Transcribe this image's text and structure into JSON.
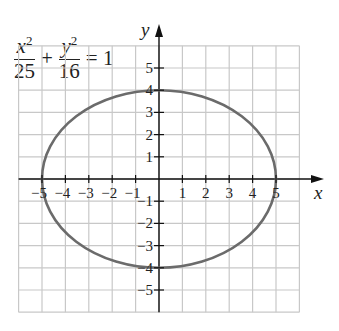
{
  "chart_data": {
    "type": "line",
    "title": "",
    "equation": {
      "term1": {
        "num_var": "x",
        "num_exp": "2",
        "den": "25"
      },
      "plus": "+",
      "term2": {
        "num_var": "y",
        "num_exp": "2",
        "den": "16"
      },
      "rhs": "= 1"
    },
    "xlabel": "x",
    "ylabel": "y",
    "xlim": [
      -6,
      6
    ],
    "ylim": [
      -6,
      6
    ],
    "grid": true,
    "x_ticks": [
      -5,
      -4,
      -3,
      -2,
      -1,
      1,
      2,
      3,
      4,
      5
    ],
    "y_ticks": [
      -5,
      -4,
      -3,
      -2,
      -1,
      1,
      2,
      3,
      4,
      5
    ],
    "series": [
      {
        "name": "ellipse x^2/25 + y^2/16 = 1",
        "shape": "ellipse",
        "center": [
          0,
          0
        ],
        "semi_major_x": 5,
        "semi_minor_y": 4,
        "key_points": [
          [
            5,
            0
          ],
          [
            0,
            4
          ],
          [
            -5,
            0
          ],
          [
            0,
            -4
          ]
        ],
        "color": "#6b6b6b"
      }
    ]
  },
  "colors": {
    "grid": "#c8c8c8",
    "axis": "#111111",
    "curve": "#6b6b6b",
    "text": "#222222"
  }
}
